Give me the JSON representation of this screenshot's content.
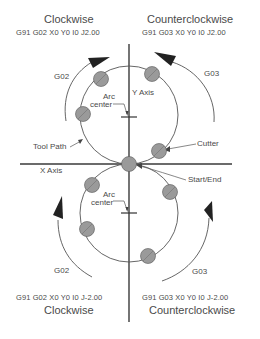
{
  "quadrants": {
    "top_left": {
      "title": "Clockwise",
      "code": "G91 G02  X0  Y0  I0  J2.00",
      "arc_label": "G02"
    },
    "top_right": {
      "title": "Counterclockwise",
      "code": "G91 G03  X0  Y0  I0  J2.00",
      "arc_label": "G03"
    },
    "bottom_left": {
      "title": "Clockwise",
      "code": "G91 G02  X0  Y0  I0  J-2.00",
      "arc_label": "G02"
    },
    "bottom_right": {
      "title": "Counterclockwise",
      "code": "G91 G03  X0  Y0  I0  J-2.00",
      "arc_label": "G03"
    }
  },
  "labels": {
    "y_axis": "Y Axis",
    "x_axis": "X Axis",
    "arc_center_top_1": "Arc",
    "arc_center_top_2": "center",
    "arc_center_bottom_1": "Arc",
    "arc_center_bottom_2": "center",
    "tool_path": "Tool Path",
    "cutter": "Cutter",
    "start_end": "Start/End"
  },
  "colors": {
    "line": "#3a3a3a",
    "cutter_fill": "#9a9a9a",
    "text": "#4a4a4a"
  }
}
